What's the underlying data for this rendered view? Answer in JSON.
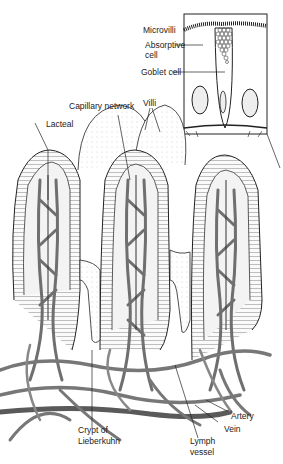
{
  "diagram": {
    "labels": {
      "microvilli": "Microvilli",
      "absorptive_cell_1": "Absorptive",
      "absorptive_cell_2": "cell",
      "goblet_cell": "Goblet cell",
      "villi": "Villi",
      "capillary_network": "Capillary network",
      "lacteal": "Lacteal",
      "crypt_1": "Crypt of",
      "crypt_2": "Lieberkuhn",
      "artery": "Artery",
      "vein": "Vein",
      "lymph_1": "Lymph",
      "lymph_2": "vessel"
    },
    "colors": {
      "line": "#222222",
      "vessel": "#777777",
      "vessel_dark": "#555555",
      "cell_fill": "#f4f4f4"
    }
  }
}
